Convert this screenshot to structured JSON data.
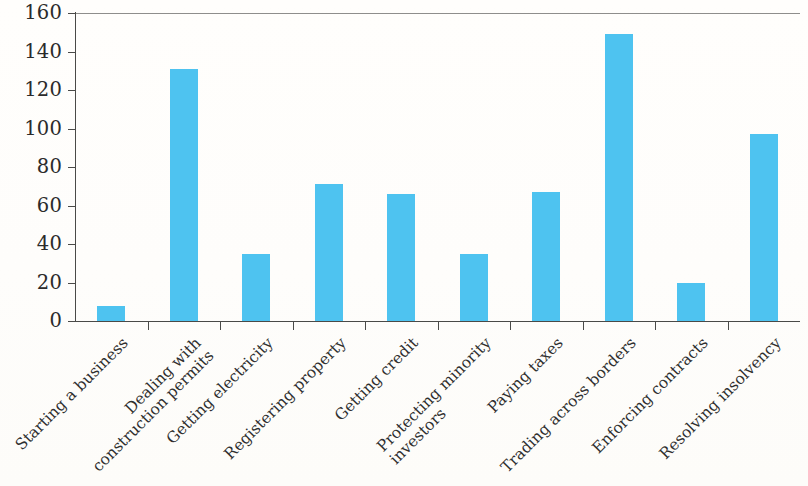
{
  "chart_data": {
    "type": "bar",
    "title": "",
    "subtitle": "",
    "xlabel": "",
    "ylabel": "",
    "ylim": [
      0,
      160
    ],
    "ytick_values": [
      0,
      20,
      40,
      60,
      80,
      100,
      120,
      140,
      160
    ],
    "ytick_labels": [
      "0",
      "20",
      "40",
      "60",
      "80",
      "100",
      "120",
      "140",
      "160"
    ],
    "grid": false,
    "legend": false,
    "legend_position": "none",
    "bar_color": "#4ec3f0",
    "axis_color": "#4a4a48",
    "categories": [
      "Starting a business",
      "Dealing with construction permits",
      "Getting electricity",
      "Registering property",
      "Getting credit",
      "Protecting minority investors",
      "Paying taxes",
      "Trading across borders",
      "Enforcing contracts",
      "Resolving insolvency"
    ],
    "category_lines": [
      [
        "Starting a business"
      ],
      [
        "Dealing with",
        "construction permits"
      ],
      [
        "Getting electricity"
      ],
      [
        "Registering property"
      ],
      [
        "Getting credit"
      ],
      [
        "Protecting minority",
        "investors"
      ],
      [
        "Paying taxes"
      ],
      [
        "Trading across borders"
      ],
      [
        "Enforcing contracts"
      ],
      [
        "Resolving insolvency"
      ]
    ],
    "values": [
      8,
      131,
      35,
      71,
      66,
      35,
      67,
      149,
      20,
      97
    ]
  }
}
